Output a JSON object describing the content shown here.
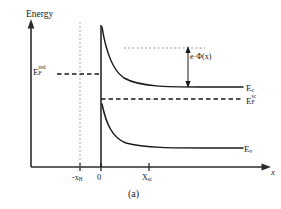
{
  "figure": {
    "caption": "(a)",
    "axes": {
      "y_label": "Energy",
      "x_label": "x"
    },
    "x_ticks": [
      {
        "name": "hydrogen-layer-boundary",
        "label_main": "-x",
        "label_sub": "H",
        "x_px": 80
      },
      {
        "name": "interface-origin",
        "label_main": "0",
        "label_sub": "",
        "x_px": 101
      },
      {
        "name": "space-charge-width",
        "label_main": "X",
        "label_sub": "sc",
        "x_px": 149
      }
    ],
    "curves": [
      {
        "name": "conduction-band",
        "label_main": "E",
        "label_sub": "c",
        "flat_level_px": 87,
        "style": "solid"
      },
      {
        "name": "valence-band",
        "label_main": "E",
        "label_sub": "v",
        "flat_level_px": 148,
        "style": "solid"
      }
    ],
    "levels": [
      {
        "name": "redox-fermi-level",
        "label_main": "E",
        "label_sub": "F",
        "label_sup": "red",
        "y_px": 74,
        "style": "dashed",
        "extent": "left-of-interface"
      },
      {
        "name": "semiconductor-fermi-level",
        "label_main": "E",
        "label_sub": "F",
        "label_sup": "sc",
        "y_px": 99,
        "style": "dashed",
        "extent": "right-of-interface"
      }
    ],
    "annotation": {
      "name": "band-bending-energy",
      "text_main": "e",
      "text_symbol": "·Φ(x)",
      "arrow_top_px": 48,
      "arrow_bottom_px": 87,
      "reference_line_style": "dotted"
    },
    "colors": {
      "ink": "#1a1a1a",
      "axis": "#2b2b2b",
      "dotted_guide": "#9a9a9a",
      "background": "#ffffff"
    }
  }
}
